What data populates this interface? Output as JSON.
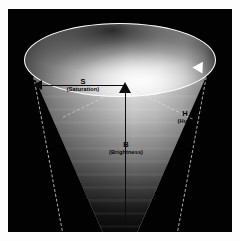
{
  "figure": {
    "background_color": "#020202",
    "frame_color": "#fdfdfd"
  },
  "axes": [
    {
      "id": "saturation",
      "symbol": "S",
      "name": "(Saturation)",
      "direction": "radial, centre to left edge of top disc",
      "arrow_color": "#0b0b0b"
    },
    {
      "id": "brightness",
      "symbol": "B",
      "name": "(Brightness)",
      "direction": "vertical, apex upward to centre of top disc",
      "arrow_color": "#0b0b0b"
    },
    {
      "id": "hue",
      "symbol": "H",
      "name": "(Hue)",
      "direction": "angular, around the rim of the top disc",
      "arrow_color": "#ffffff"
    }
  ],
  "geometry": {
    "shape": "inverted-cone",
    "top_disc_label": "top disc (maximum brightness)",
    "ring_label": "hue circle outline",
    "apex_label": "apex (black point)",
    "band_label": "cone wall shading bands"
  },
  "chart_data": {
    "type": "diagram",
    "annotations": [
      "S",
      "(Saturation)",
      "B",
      "(Brightness)",
      "H",
      "(Hue)"
    ]
  }
}
